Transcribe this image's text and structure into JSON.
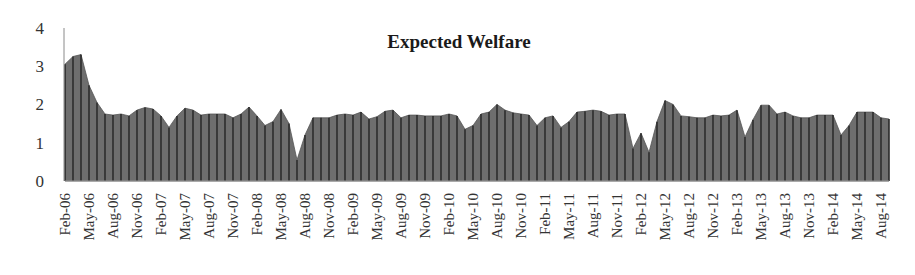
{
  "chart_data": {
    "type": "area",
    "title": "Expected Welfare",
    "xlabel": "",
    "ylabel": "",
    "ylim": [
      0,
      4
    ],
    "yticks": [
      0,
      1,
      2,
      3,
      4
    ],
    "grid": false,
    "legend": null,
    "fill_color": "#6e6e6e",
    "drop_line_color": "#1e1e1e",
    "start_month": "Feb-06",
    "frequency": "monthly",
    "xtick_labels": [
      "Feb-06",
      "May-06",
      "Aug-06",
      "Nov-06",
      "Feb-07",
      "May-07",
      "Aug-07",
      "Nov-07",
      "Feb-08",
      "May-08",
      "Aug-08",
      "Nov-08",
      "Feb-09",
      "May-09",
      "Aug-09",
      "Nov-09",
      "Feb-10",
      "May-10",
      "Aug-10",
      "Nov-10",
      "Feb-11",
      "May-11",
      "Aug-11",
      "Nov-11",
      "Feb-12",
      "May-12",
      "Aug-12",
      "Nov-12",
      "Feb-13",
      "May-13",
      "Aug-13",
      "Nov-13",
      "Feb-14",
      "May-14",
      "Aug-14"
    ],
    "values": [
      3.05,
      3.25,
      3.3,
      2.5,
      2.05,
      1.75,
      1.72,
      1.75,
      1.7,
      1.85,
      1.92,
      1.88,
      1.7,
      1.4,
      1.7,
      1.9,
      1.85,
      1.72,
      1.75,
      1.75,
      1.75,
      1.65,
      1.75,
      1.93,
      1.7,
      1.45,
      1.55,
      1.87,
      1.5,
      0.55,
      1.2,
      1.65,
      1.65,
      1.65,
      1.72,
      1.75,
      1.72,
      1.8,
      1.62,
      1.68,
      1.82,
      1.85,
      1.65,
      1.72,
      1.72,
      1.7,
      1.7,
      1.7,
      1.75,
      1.7,
      1.35,
      1.45,
      1.75,
      1.8,
      2.0,
      1.85,
      1.78,
      1.75,
      1.72,
      1.45,
      1.65,
      1.7,
      1.4,
      1.55,
      1.8,
      1.82,
      1.85,
      1.82,
      1.72,
      1.75,
      1.75,
      0.85,
      1.25,
      0.75,
      1.55,
      2.1,
      2.0,
      1.7,
      1.68,
      1.65,
      1.65,
      1.72,
      1.7,
      1.72,
      1.85,
      1.15,
      1.6,
      1.98,
      1.98,
      1.75,
      1.8,
      1.7,
      1.65,
      1.65,
      1.72,
      1.72,
      1.72,
      1.2,
      1.45,
      1.8,
      1.8,
      1.8,
      1.65,
      1.62
    ]
  }
}
